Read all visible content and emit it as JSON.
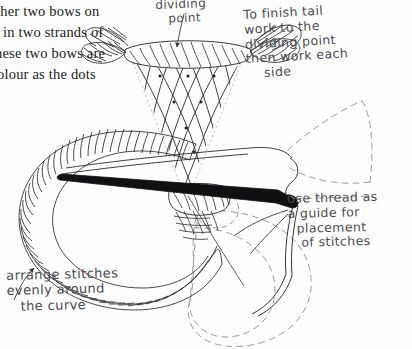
{
  "page": {
    "kind": "scanned-book-page",
    "width": 412,
    "height": 349,
    "background_color": "#fefefe",
    "ink_color": "#1a1a1a",
    "pencil_color": "#4a4a52"
  },
  "printed_text": {
    "lines": [
      "ther two bows on",
      "in two strands of",
      "hese two bows are",
      "olour as the dots"
    ],
    "top_partial_line": "",
    "note": "left edge of printed column is cropped off"
  },
  "annotations": [
    {
      "id": "dividing-point",
      "text": "dividing\n   point",
      "lines": [
        "dividing",
        "point"
      ],
      "leader": "arrow-down-to-cone-top"
    },
    {
      "id": "finish-tail",
      "text": "To finish tail\nwork to the\ndividing point\nthen work each\n    side",
      "lines": [
        "To finish tail",
        "work to the",
        "dividing point",
        "then work each",
        "side"
      ],
      "leader": "none"
    },
    {
      "id": "thread-guide",
      "text": "use thread as\na guide for\n  placement\n   of stitches",
      "lines": [
        "use thread as",
        "a guide for",
        "placement",
        "of stitches"
      ],
      "leader": "curve-to-thread"
    },
    {
      "id": "arrange-stitches",
      "text": "arrange stitches\nevenly around\n   the curve",
      "lines": [
        "arrange stitches",
        "evenly around",
        "the curve"
      ],
      "leader": "curved-arrow-up-right"
    }
  ],
  "diagram": {
    "elements": [
      {
        "name": "cone-lattice",
        "description": "tapered trellis filling of crossing curved lines with dots at intersections"
      },
      {
        "name": "cone-top-band",
        "description": "satin-stitched horizontal band at the top of the cone"
      },
      {
        "name": "cone-bottom-band",
        "description": "satin-stitched band at the bottom of the cone"
      },
      {
        "name": "left-bow-loop",
        "description": "large satin-stitched loop worked in close parallel stitches"
      },
      {
        "name": "right-wing",
        "description": "short satin-stitched segment right of the cone"
      },
      {
        "name": "needle",
        "description": "black sewing needle piercing through the work, point to the left"
      },
      {
        "name": "working-thread",
        "description": "thread curving down from the needle eye"
      },
      {
        "name": "dashed-loop",
        "description": "dashed outline of the second (unworked) bow loop"
      },
      {
        "name": "dashed-tail",
        "description": "dashed outline of the bow tail, upper right"
      },
      {
        "name": "dashed-small-loop",
        "description": "small dashed loop near the centre"
      }
    ]
  }
}
